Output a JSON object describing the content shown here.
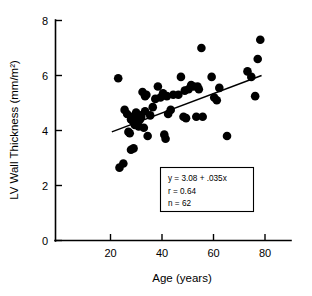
{
  "chart_data": {
    "type": "scatter",
    "title": "",
    "xlabel": "Age (years)",
    "ylabel": "LV Wall Thickness (mm/m²)",
    "xlim": [
      0,
      92
    ],
    "ylim": [
      0,
      8
    ],
    "xticks": [
      20,
      40,
      60,
      80
    ],
    "yticks": [
      0,
      2,
      4,
      6,
      8
    ],
    "xtick_labels": [
      "20",
      "40",
      "60",
      "80"
    ],
    "ytick_labels": [
      "0",
      "2",
      "4",
      "6",
      "8"
    ],
    "grid": false,
    "legend": null,
    "marker_color": "#000000",
    "marker_size": 4.3,
    "x": [
      24.5,
      25.0,
      26.5,
      27.0,
      28.0,
      28.5,
      29.0,
      29.5,
      29.5,
      30.0,
      30.5,
      30.5,
      31.0,
      31.0,
      31.5,
      32.0,
      32.0,
      32.5,
      33.0,
      33.0,
      33.5,
      34.0,
      34.5,
      35.0,
      35.0,
      35.5,
      36.0,
      37.0,
      38.0,
      39.0,
      40.0,
      41.0,
      42.0,
      42.5,
      43.0,
      43.5,
      44.0,
      45.0,
      46.0,
      48.0,
      49.0,
      50.0,
      50.5,
      51.0,
      52.0,
      53.0,
      54.0,
      55.0,
      55.5,
      56.0,
      57.0,
      57.5,
      61.0,
      62.0,
      63.0,
      64.0,
      67.0,
      75.0,
      76.5,
      78.0,
      79.0,
      80.0
    ],
    "y": [
      5.9,
      2.65,
      2.8,
      4.75,
      4.6,
      3.95,
      3.9,
      3.3,
      4.4,
      4.5,
      3.35,
      4.3,
      4.35,
      4.2,
      4.65,
      4.3,
      4.45,
      4.15,
      4.4,
      4.55,
      4.5,
      5.4,
      4.1,
      4.7,
      5.25,
      5.3,
      3.8,
      4.55,
      4.85,
      5.15,
      5.6,
      5.2,
      5.35,
      3.85,
      3.7,
      5.25,
      4.6,
      4.75,
      5.3,
      5.3,
      5.95,
      4.5,
      5.45,
      4.45,
      5.5,
      5.65,
      5.6,
      4.5,
      5.6,
      5.5,
      7.0,
      4.5,
      5.95,
      5.2,
      5.1,
      5.55,
      3.8,
      6.15,
      5.95,
      5.25,
      6.6,
      7.3
    ],
    "n_points": 62,
    "fit": {
      "equation": "y = 3.08 + .035x",
      "intercept": 3.08,
      "slope": 0.035,
      "x_start": 22,
      "x_end": 80.5,
      "y_start": 3.95,
      "y_end": 6.0
    },
    "annotation": {
      "line1": "y = 3.08 + .035x",
      "line2": "r = 0.64",
      "line3": "n = 62"
    },
    "stats": {
      "r_label": "r",
      "r_value": "0.64",
      "n_label": "n",
      "n_value": "62"
    }
  }
}
